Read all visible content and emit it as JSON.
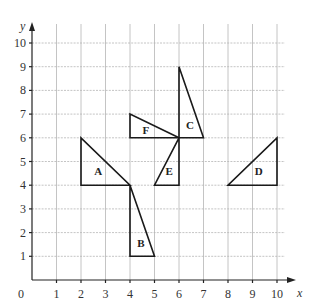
{
  "diagram": {
    "type": "coordinate-grid",
    "x_axis": {
      "label": "x",
      "min": 0,
      "max": 10,
      "ticks": [
        "0",
        "1",
        "2",
        "3",
        "4",
        "5",
        "6",
        "7",
        "8",
        "9",
        "10"
      ]
    },
    "y_axis": {
      "label": "y",
      "min": 0,
      "max": 10,
      "ticks": [
        "1",
        "2",
        "3",
        "4",
        "5",
        "6",
        "7",
        "8",
        "9",
        "10"
      ]
    },
    "triangles": [
      {
        "label": "A",
        "vertices": [
          [
            2,
            6
          ],
          [
            2,
            4
          ],
          [
            4,
            4
          ]
        ],
        "label_at": [
          2.7,
          4.6
        ]
      },
      {
        "label": "B",
        "vertices": [
          [
            4,
            4
          ],
          [
            4,
            1
          ],
          [
            5,
            1
          ]
        ],
        "label_at": [
          4.45,
          1.55
        ]
      },
      {
        "label": "C",
        "vertices": [
          [
            6,
            9
          ],
          [
            6,
            6
          ],
          [
            7,
            6
          ]
        ],
        "label_at": [
          6.45,
          6.55
        ]
      },
      {
        "label": "D",
        "vertices": [
          [
            8,
            4
          ],
          [
            10,
            4
          ],
          [
            10,
            6
          ]
        ],
        "label_at": [
          9.25,
          4.6
        ]
      },
      {
        "label": "E",
        "vertices": [
          [
            6,
            6
          ],
          [
            6,
            4
          ],
          [
            5,
            4
          ]
        ],
        "label_at": [
          5.6,
          4.6
        ]
      },
      {
        "label": "F",
        "vertices": [
          [
            4,
            7
          ],
          [
            4,
            6
          ],
          [
            6,
            6
          ]
        ],
        "label_at": [
          4.65,
          6.35
        ]
      }
    ]
  }
}
